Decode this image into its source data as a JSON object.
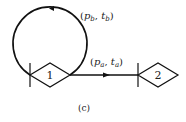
{
  "diagram": {
    "caption": "(c)",
    "nodes": [
      {
        "id": "1",
        "label": "1"
      },
      {
        "id": "2",
        "label": "2"
      }
    ],
    "edges": [
      {
        "from": "1",
        "to": "1",
        "kind": "self-loop",
        "label": {
          "p": "p",
          "p_sub": "b",
          "t": "t",
          "t_sub": "b"
        }
      },
      {
        "from": "1",
        "to": "2",
        "kind": "directed",
        "label": {
          "p": "p",
          "p_sub": "a",
          "t": "t",
          "t_sub": "a"
        }
      }
    ],
    "colors": {
      "stroke": "#111111",
      "text": "#222222",
      "background": "#ffffff"
    }
  }
}
